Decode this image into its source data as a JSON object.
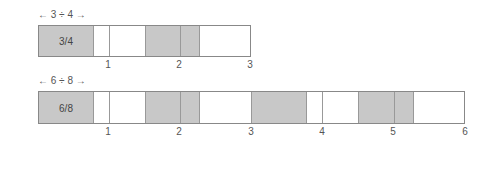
{
  "diagrams": [
    {
      "label": "←   3 ÷ 4   →",
      "fraction_label": "3/4",
      "units": 3,
      "block_size": 0.75,
      "shaded_blocks": [
        [
          0,
          0.75
        ],
        [
          1.5,
          2.25
        ]
      ],
      "ticks": [
        "1",
        "2",
        "3"
      ]
    },
    {
      "label": "←   6 ÷ 8   →",
      "fraction_label": "6/8",
      "units": 6,
      "block_size": 0.75,
      "shaded_blocks": [
        [
          0,
          0.75
        ],
        [
          1.5,
          2.25
        ],
        [
          3,
          3.75
        ],
        [
          4.5,
          5.25
        ]
      ],
      "ticks": [
        "1",
        "2",
        "3",
        "4",
        "5",
        "6"
      ]
    }
  ],
  "colors": {
    "shaded": "#c8c8c8",
    "border": "#888888"
  }
}
